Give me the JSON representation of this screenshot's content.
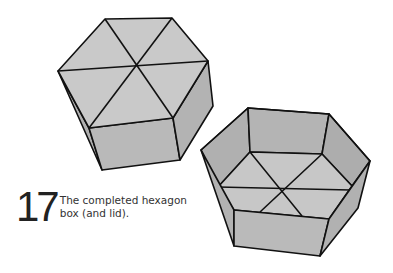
{
  "caption": {
    "step_number": "17",
    "text_line1": "The completed hexagon",
    "text_line2": "box (and lid)."
  },
  "colors": {
    "stroke": "#111111",
    "top_face": "#c8c8c8",
    "side_face": "#b4b4b4",
    "front_face": "#b9b9b9",
    "inner_wall": "#aeaeae",
    "floor": "#c6c6c6"
  },
  "figures": [
    {
      "name": "hexagon-lid",
      "description": "Closed hexagonal lid with six triangular top panels"
    },
    {
      "name": "hexagon-box",
      "description": "Open hexagonal box showing inner floor with six triangles"
    }
  ]
}
